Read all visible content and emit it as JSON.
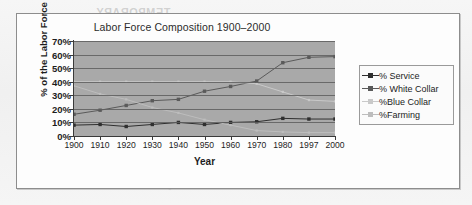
{
  "page": {
    "ghost_text_1": "TEMPORARY",
    "ghost_text_2": "EMPLOYMENT"
  },
  "chart_data": {
    "type": "line",
    "title": "Labor Force Composition 1900–2000",
    "xlabel": "Year",
    "ylabel": "% of the Labor Force",
    "categories": [
      "1900",
      "1910",
      "1920",
      "1930",
      "1940",
      "1950",
      "1960",
      "1970",
      "1980",
      "1997",
      "2000"
    ],
    "ylim": [
      0,
      70
    ],
    "ytick_labels": [
      "0%",
      "10%",
      "20%",
      "30%",
      "40%",
      "50%",
      "60%",
      "70%"
    ],
    "ytick_values": [
      0,
      10,
      20,
      30,
      40,
      50,
      60,
      70
    ],
    "grid": true,
    "legend_position": "right",
    "series": [
      {
        "name": "% Service",
        "color": "#2f2f2f",
        "marker": "square",
        "values": [
          8,
          8.5,
          7,
          8.5,
          10,
          8.5,
          10,
          10.5,
          13,
          12.5,
          12.5
        ]
      },
      {
        "name": "% White Collar",
        "color": "#5a5a5a",
        "marker": "square",
        "values": [
          16,
          19,
          22.5,
          26,
          27,
          33,
          36.5,
          40.5,
          54,
          58,
          58.5
        ]
      },
      {
        "name": "%Blue Collar",
        "color": "#c9c9c9",
        "marker": "square",
        "values": [
          40,
          40,
          40,
          40,
          40,
          40,
          40,
          38.5,
          32.5,
          26.5,
          25.5
        ]
      },
      {
        "name": "%Farming",
        "color": "#bdbdbd",
        "marker": "square",
        "values": [
          37,
          31,
          27,
          21,
          17,
          12,
          8,
          4,
          3,
          2.5,
          2.5
        ]
      }
    ]
  },
  "colors": {
    "plot_background": "#a9a9a9",
    "frame_border": "#8d8d8d",
    "gridline": "#5e5e5e",
    "page_background": "#f4f4f4"
  }
}
